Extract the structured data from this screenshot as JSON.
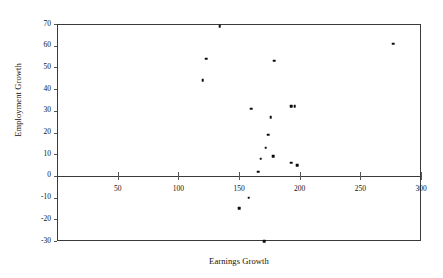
{
  "chart_data": {
    "type": "scatter",
    "title": "",
    "xlabel": "Earnings Growth",
    "ylabel": "Employment Growth",
    "xlim": [
      0,
      300
    ],
    "ylim": [
      -30,
      70
    ],
    "xticks": [
      50,
      100,
      150,
      200,
      250,
      300
    ],
    "yticks": [
      70,
      60,
      50,
      40,
      30,
      20,
      10,
      0,
      -10,
      -20,
      -30
    ],
    "xtick_labels": [
      "50",
      "100",
      "150",
      "200",
      "250",
      "300"
    ],
    "ytick_labels": [
      "70",
      "60",
      "50",
      "40",
      "30",
      "20",
      "10",
      "0",
      "-10",
      "-20",
      "-30"
    ],
    "grid": false,
    "legend": null,
    "zero_line": 0,
    "marker": "square",
    "marker_color": "#0d0d0d",
    "axis_color": "#3a3a3a",
    "points": [
      {
        "x": 134,
        "y": 69
      },
      {
        "x": 123,
        "y": 54
      },
      {
        "x": 120,
        "y": 44
      },
      {
        "x": 179,
        "y": 53
      },
      {
        "x": 277,
        "y": 61
      },
      {
        "x": 160,
        "y": 31
      },
      {
        "x": 193,
        "y": 32
      },
      {
        "x": 196,
        "y": 32
      },
      {
        "x": 176,
        "y": 27
      },
      {
        "x": 174,
        "y": 19
      },
      {
        "x": 172,
        "y": 13
      },
      {
        "x": 168,
        "y": 8
      },
      {
        "x": 178,
        "y": 9
      },
      {
        "x": 193,
        "y": 6
      },
      {
        "x": 198,
        "y": 5
      },
      {
        "x": 166,
        "y": 2
      },
      {
        "x": 158,
        "y": -10
      },
      {
        "x": 150,
        "y": -15
      },
      {
        "x": 171,
        "y": -30
      }
    ]
  },
  "axes": {
    "x_title": "Earnings Growth",
    "y_title": "Employment Growth"
  }
}
